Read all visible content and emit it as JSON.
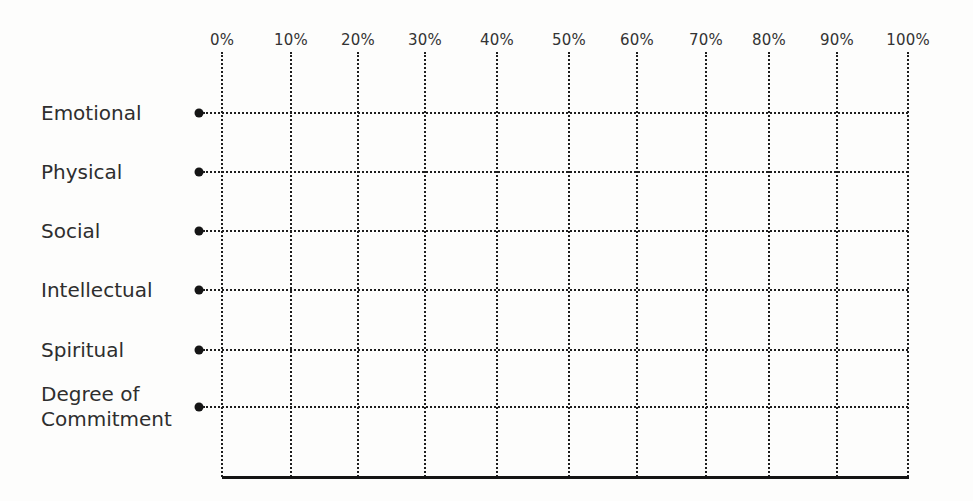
{
  "chart_data": {
    "type": "table",
    "title": "",
    "xlabel": "",
    "ylabel": "",
    "x_ticks": [
      "0%",
      "10%",
      "20%",
      "30%",
      "40%",
      "50%",
      "60%",
      "70%",
      "80%",
      "90%",
      "100%"
    ],
    "xlim": [
      0,
      100
    ],
    "grid": true,
    "grid_style": "dotted",
    "categories": [
      "Emotional",
      "Physical",
      "Social",
      "Intellectual",
      "Spiritual",
      "Degree of Commitment"
    ],
    "series": []
  },
  "axis": {
    "ticks": [
      {
        "label": "0%",
        "x": 222
      },
      {
        "label": "10%",
        "x": 291
      },
      {
        "label": "20%",
        "x": 358
      },
      {
        "label": "30%",
        "x": 425
      },
      {
        "label": "40%",
        "x": 497
      },
      {
        "label": "50%",
        "x": 569
      },
      {
        "label": "60%",
        "x": 637
      },
      {
        "label": "70%",
        "x": 706
      },
      {
        "label": "80%",
        "x": 769
      },
      {
        "label": "90%",
        "x": 837
      },
      {
        "label": "100%",
        "x": 908
      }
    ]
  },
  "rows": [
    {
      "label": "Emotional",
      "y": 113
    },
    {
      "label": "Physical",
      "y": 172
    },
    {
      "label": "Social",
      "y": 231
    },
    {
      "label": "Intellectual",
      "y": 290
    },
    {
      "label": "Spiritual",
      "y": 350
    },
    {
      "label": "Degree of\nCommitment",
      "y": 407
    }
  ],
  "layout": {
    "bullet_x": 199,
    "grid_left": 222,
    "grid_right": 908,
    "baseline_y": 476
  },
  "colors": {
    "ink": "#1e1e1e",
    "text": "#2e2e2e",
    "background": "#fdfdfc"
  }
}
